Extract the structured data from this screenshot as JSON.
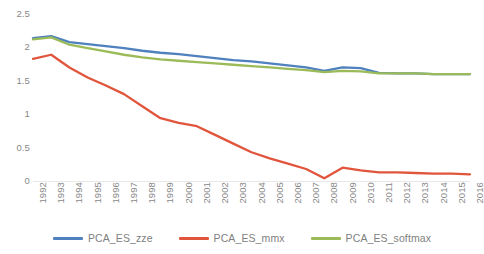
{
  "chart_data": {
    "type": "line",
    "title": "",
    "xlabel": "",
    "ylabel": "",
    "grid": false,
    "legend_position": "bottom",
    "ylim": [
      0,
      2.5
    ],
    "ytick_labels": [
      "2.5",
      "2",
      "1.5",
      "1",
      "0.5",
      "0"
    ],
    "yticks": [
      2.5,
      2,
      1.5,
      1,
      0.5,
      0
    ],
    "categories": [
      "1992",
      "1993",
      "1994",
      "1995",
      "1996",
      "1997",
      "1998",
      "1999",
      "2000",
      "2001",
      "2002",
      "2003",
      "2004",
      "2005",
      "2006",
      "2007",
      "2008",
      "2009",
      "2010",
      "2011",
      "2012",
      "2013",
      "2014",
      "2015",
      "2016"
    ],
    "series": [
      {
        "name": "PCA_ES_zze",
        "color": "#4E81BD",
        "values": [
          2.14,
          2.17,
          2.08,
          2.05,
          2.02,
          1.99,
          1.95,
          1.92,
          1.9,
          1.87,
          1.84,
          1.81,
          1.79,
          1.76,
          1.73,
          1.7,
          1.65,
          1.7,
          1.69,
          1.62,
          1.61,
          1.61,
          1.6,
          1.6,
          1.6
        ]
      },
      {
        "name": "PCA_ES_mmx",
        "color": "#E0553B",
        "values": [
          1.83,
          1.89,
          1.7,
          1.55,
          1.43,
          1.3,
          1.12,
          0.94,
          0.87,
          0.82,
          0.69,
          0.56,
          0.43,
          0.34,
          0.26,
          0.18,
          0.04,
          0.2,
          0.16,
          0.13,
          0.13,
          0.12,
          0.11,
          0.11,
          0.1
        ]
      },
      {
        "name": "PCA_ES_softmax",
        "color": "#9BBB59",
        "values": [
          2.12,
          2.15,
          2.04,
          1.99,
          1.94,
          1.89,
          1.85,
          1.82,
          1.8,
          1.78,
          1.76,
          1.74,
          1.72,
          1.7,
          1.68,
          1.66,
          1.63,
          1.65,
          1.64,
          1.61,
          1.61,
          1.61,
          1.6,
          1.6,
          1.6
        ]
      }
    ]
  },
  "legend": {
    "items": [
      {
        "label": "PCA_ES_zze",
        "color": "#4E81BD"
      },
      {
        "label": "PCA_ES_mmx",
        "color": "#E0553B"
      },
      {
        "label": "PCA_ES_softmax",
        "color": "#9BBB59"
      }
    ]
  }
}
